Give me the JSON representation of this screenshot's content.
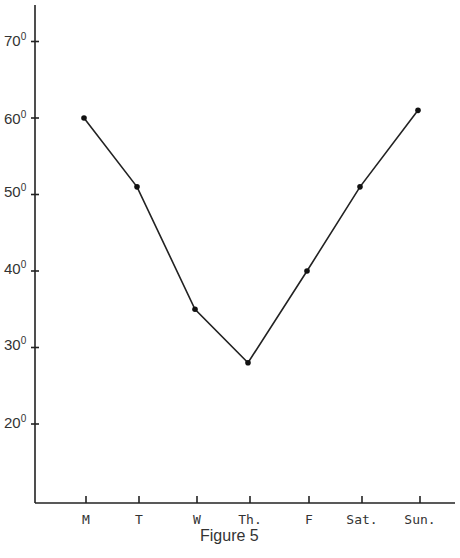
{
  "chart_data": {
    "type": "line",
    "title": "",
    "caption": "Figure 5",
    "xlabel": "",
    "ylabel": "",
    "categories": [
      "M",
      "T",
      "W",
      "Th.",
      "F",
      "Sat.",
      "Sun."
    ],
    "series": [
      {
        "name": "Temperature",
        "values": [
          60,
          51,
          35,
          28,
          40,
          51,
          61
        ]
      }
    ],
    "y_ticks": [
      20,
      30,
      40,
      50,
      60,
      70
    ],
    "y_tick_labels": [
      "20°",
      "30°",
      "40°",
      "50°",
      "60°",
      "70°"
    ],
    "ylim": [
      10,
      74
    ],
    "grid": false,
    "legend": "none",
    "markers": true,
    "line_color": "#222222"
  },
  "labels": {
    "caption": "Figure 5",
    "y": [
      {
        "num": "70",
        "deg": "0"
      },
      {
        "num": "60",
        "deg": "0"
      },
      {
        "num": "50",
        "deg": "0"
      },
      {
        "num": "40",
        "deg": "0"
      },
      {
        "num": "30",
        "deg": "0"
      },
      {
        "num": "20",
        "deg": "0"
      }
    ],
    "x": [
      "M",
      "T",
      "W",
      "Th.",
      "F",
      "Sat.",
      "Sun."
    ]
  }
}
